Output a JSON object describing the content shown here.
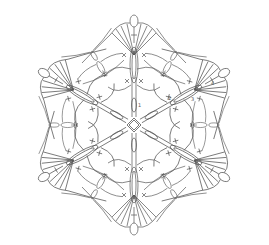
{
  "diagram": {
    "symmetry": 6,
    "center": [
      134,
      125
    ],
    "stroke_color": "#555555",
    "background": "#ffffff",
    "round_labels": [
      "1",
      "2",
      "3",
      "4"
    ],
    "symbols": [
      "chain-oval",
      "single-crochet-cross",
      "double-crochet-post",
      "picot-loop"
    ]
  }
}
